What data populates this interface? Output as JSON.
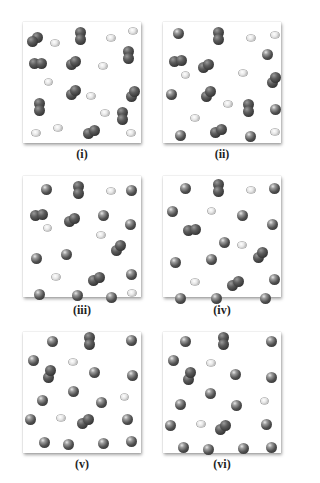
{
  "figure": {
    "panels": [
      {
        "id": "i",
        "label": "(i)",
        "x": 23,
        "y": 22
      },
      {
        "id": "ii",
        "label": "(ii)",
        "x": 163,
        "y": 22
      },
      {
        "id": "iii",
        "label": "(iii)",
        "x": 23,
        "y": 176
      },
      {
        "id": "iv",
        "label": "(iv)",
        "x": 163,
        "y": 176
      },
      {
        "id": "v",
        "label": "(v)",
        "x": 23,
        "y": 332
      },
      {
        "id": "vi",
        "label": "(vi)",
        "x": 163,
        "y": 332
      }
    ],
    "labels": {
      "i": "(i)",
      "ii": "(ii)",
      "iii": "(iii)",
      "iv": "(iv)",
      "v": "(v)",
      "vi": "(vi)"
    },
    "colors": {
      "dark_atom": "#3a3a3a",
      "light_atom": "#e6e6e6",
      "background": "#ffffff"
    }
  }
}
